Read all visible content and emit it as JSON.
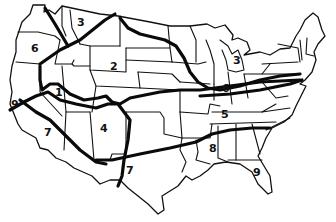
{
  "map": {
    "subject": "Hand-drawn outline map of the contiguous United States divided into numbered zones",
    "colors": {
      "ink": "#111111",
      "background": "#ffffff"
    },
    "zone_labels": [
      {
        "id": "z1",
        "text": "1",
        "x": 55,
        "y": 96
      },
      {
        "id": "z2",
        "text": "2",
        "x": 110,
        "y": 70
      },
      {
        "id": "z3a",
        "text": "3",
        "x": 77,
        "y": 26
      },
      {
        "id": "z3b",
        "text": "3",
        "x": 233,
        "y": 64
      },
      {
        "id": "z4",
        "text": "4",
        "x": 100,
        "y": 132
      },
      {
        "id": "z5",
        "text": "5",
        "x": 221,
        "y": 118
      },
      {
        "id": "z6a",
        "text": "6",
        "x": 31,
        "y": 52
      },
      {
        "id": "z6b",
        "text": "6",
        "x": 222,
        "y": 92
      },
      {
        "id": "z7a",
        "text": "7",
        "x": 44,
        "y": 136
      },
      {
        "id": "z7b",
        "text": "7",
        "x": 126,
        "y": 174
      },
      {
        "id": "z8",
        "text": "8",
        "x": 209,
        "y": 152
      },
      {
        "id": "z9a",
        "text": "9",
        "x": 11,
        "y": 108
      },
      {
        "id": "z9b",
        "text": "9",
        "x": 253,
        "y": 176
      }
    ]
  }
}
